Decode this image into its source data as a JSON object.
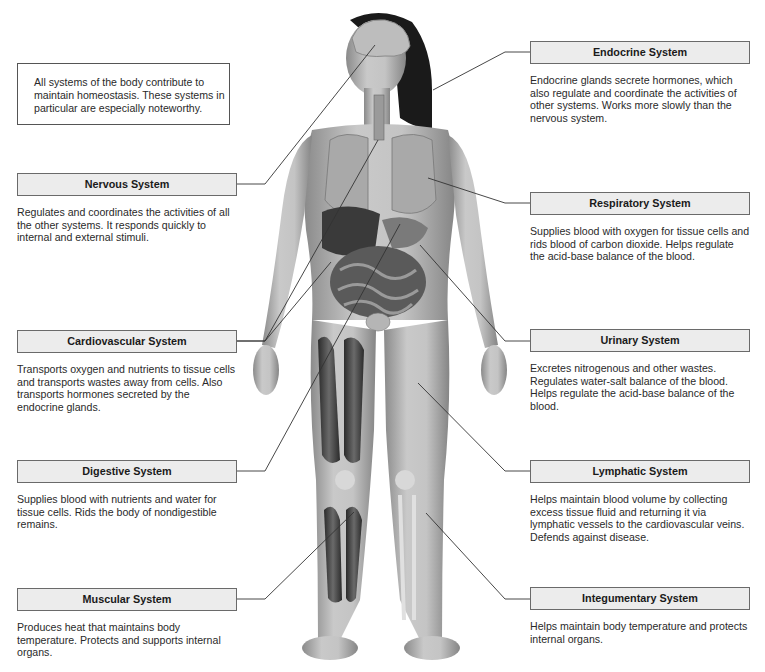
{
  "intro": {
    "text": "All systems of the body contribute to maintain homeostasis. These systems in particular are especially noteworthy."
  },
  "left_systems": [
    {
      "title": "Nervous System",
      "description": "Regulates and coordinates the activities of all the other systems. It responds quickly to internal and external stimuli."
    },
    {
      "title": "Cardiovascular System",
      "description": "Transports oxygen and nutrients to tissue cells and transports wastes away from cells. Also transports hormones secreted by the endocrine glands."
    },
    {
      "title": "Digestive System",
      "description": "Supplies blood with nutrients and water for tissue cells. Rids the body of nondigestible remains."
    },
    {
      "title": "Muscular System",
      "description": "Produces heat that maintains body temperature. Protects and supports internal organs."
    }
  ],
  "right_systems": [
    {
      "title": "Endocrine System",
      "description": "Endocrine glands secrete hormones, which also regulate and coordinate the activities of other systems. Works more slowly than the nervous system."
    },
    {
      "title": "Respiratory System",
      "description": "Supplies blood with oxygen for tissue cells and rids blood of carbon dioxide. Helps regulate the acid-base balance of the blood."
    },
    {
      "title": "Urinary System",
      "description": "Excretes nitrogenous and other wastes. Regulates water-salt balance of the blood. Helps regulate the acid-base balance of the blood."
    },
    {
      "title": "Lymphatic System",
      "description": "Helps maintain blood volume by collecting excess tissue fluid and returning it via lymphatic vessels to the cardiovascular veins. Defends against disease."
    },
    {
      "title": "Integumentary System",
      "description": "Helps maintain body temperature and protects internal organs."
    }
  ],
  "colors": {
    "header_fill": "#ececec",
    "header_border": "#6a6a6a",
    "leader_line": "#333333"
  }
}
